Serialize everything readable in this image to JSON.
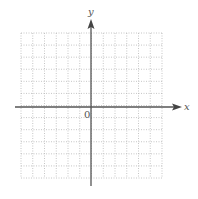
{
  "diagram": {
    "type": "coordinate-grid",
    "axes": {
      "x_label": "x",
      "y_label": "y",
      "origin_label": "0"
    },
    "grid": {
      "columns": 12,
      "rows": 12,
      "columns_left_of_y_axis": 6,
      "columns_right_of_y_axis": 6,
      "rows_above_x_axis": 6,
      "rows_below_x_axis": 6,
      "line_style": "dotted"
    },
    "colors": {
      "background": "#ffffff",
      "grid_line": "#b8b8b8",
      "axis": "#555555",
      "label": "#555555"
    }
  }
}
